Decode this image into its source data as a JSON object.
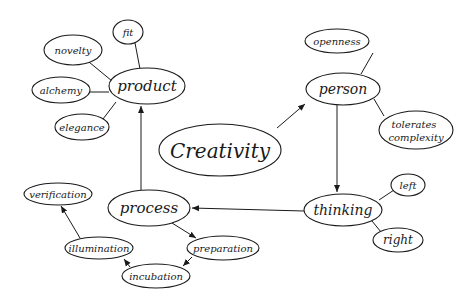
{
  "diagram": {
    "title": "Creativity",
    "type": "concept-map",
    "colors": {
      "background": "#ffffff",
      "ink": "#1a1a1a"
    },
    "nodes": {
      "creativity": {
        "label": "Creativity",
        "cx": 220,
        "cy": 150,
        "rx": 61,
        "ry": 26,
        "font_size": 20
      },
      "product": {
        "label": "product",
        "cx": 147,
        "cy": 86,
        "rx": 38,
        "ry": 18,
        "font_size": 15
      },
      "fit": {
        "label": "fit",
        "cx": 128,
        "cy": 32,
        "rx": 15,
        "ry": 12,
        "font_size": 10
      },
      "novelty": {
        "label": "novelty",
        "cx": 73,
        "cy": 50,
        "rx": 29,
        "ry": 15,
        "font_size": 10
      },
      "alchemy": {
        "label": "alchemy",
        "cx": 61,
        "cy": 90,
        "rx": 29,
        "ry": 13,
        "font_size": 10
      },
      "elegance": {
        "label": "elegance",
        "cx": 82,
        "cy": 127,
        "rx": 27,
        "ry": 13,
        "font_size": 10
      },
      "person": {
        "label": "person",
        "cx": 343,
        "cy": 89,
        "rx": 37,
        "ry": 16,
        "font_size": 14
      },
      "openness": {
        "label": "openness",
        "cx": 337,
        "cy": 41,
        "rx": 32,
        "ry": 12,
        "font_size": 10
      },
      "tolerates_complexity": {
        "label_line1": "tolerates",
        "label_line2": "complexity",
        "cx": 416,
        "cy": 130,
        "rx": 37,
        "ry": 19,
        "font_size": 10
      },
      "thinking": {
        "label": "thinking",
        "cx": 343,
        "cy": 210,
        "rx": 39,
        "ry": 16,
        "font_size": 14
      },
      "left": {
        "label": "left",
        "cx": 408,
        "cy": 185,
        "rx": 17,
        "ry": 11,
        "font_size": 10
      },
      "right": {
        "label": "right",
        "cx": 398,
        "cy": 240,
        "rx": 25,
        "ry": 12,
        "font_size": 12
      },
      "process": {
        "label": "process",
        "cx": 149,
        "cy": 208,
        "rx": 41,
        "ry": 18,
        "font_size": 15
      },
      "verification": {
        "label": "verification",
        "cx": 58,
        "cy": 194,
        "rx": 34,
        "ry": 11,
        "font_size": 10
      },
      "illumination": {
        "label": "illumination",
        "cx": 99,
        "cy": 248,
        "rx": 34,
        "ry": 11,
        "font_size": 10
      },
      "preparation": {
        "label": "preparation",
        "cx": 223,
        "cy": 248,
        "rx": 36,
        "ry": 12,
        "font_size": 10
      },
      "incubation": {
        "label": "incubation",
        "cx": 156,
        "cy": 276,
        "rx": 34,
        "ry": 12,
        "font_size": 10
      }
    },
    "edges": [
      {
        "from": "creativity",
        "to": "person",
        "arrow": true
      },
      {
        "from": "person",
        "to": "thinking",
        "arrow": true
      },
      {
        "from": "thinking",
        "to": "process",
        "arrow": true
      },
      {
        "from": "process",
        "to": "product",
        "arrow": true
      },
      {
        "from": "process",
        "to": "preparation",
        "arrow": true
      },
      {
        "from": "preparation",
        "to": "incubation",
        "arrow": true
      },
      {
        "from": "incubation",
        "to": "illumination",
        "arrow": true
      },
      {
        "from": "illumination",
        "to": "verification",
        "arrow": true
      },
      {
        "from": "product",
        "to": "fit",
        "arrow": false
      },
      {
        "from": "product",
        "to": "novelty",
        "arrow": false
      },
      {
        "from": "product",
        "to": "alchemy",
        "arrow": false
      },
      {
        "from": "product",
        "to": "elegance",
        "arrow": false
      },
      {
        "from": "person",
        "to": "openness",
        "arrow": false
      },
      {
        "from": "person",
        "to": "tolerates_complexity",
        "arrow": false
      },
      {
        "from": "thinking",
        "to": "left",
        "arrow": false
      },
      {
        "from": "thinking",
        "to": "right",
        "arrow": false
      }
    ]
  }
}
